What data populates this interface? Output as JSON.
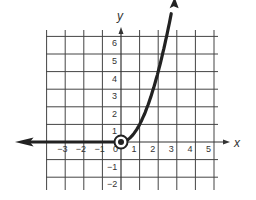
{
  "chart_data": {
    "type": "line",
    "title": "",
    "xlabel": "x",
    "ylabel": "y",
    "xlim": [
      -4,
      6
    ],
    "ylim": [
      -2,
      7
    ],
    "grid": true,
    "x_ticks": [
      -3,
      -2,
      -1,
      0,
      1,
      2,
      3,
      4,
      5
    ],
    "y_ticks": [
      -2,
      -1,
      1,
      2,
      3,
      4,
      5,
      6
    ],
    "x_tick_labels": [
      "−3",
      "−2",
      "−1",
      "0",
      "1",
      "2",
      "3",
      "4",
      "5"
    ],
    "y_tick_labels": [
      "−2",
      "−1",
      "1",
      "2",
      "3",
      "4",
      "5",
      "6"
    ],
    "series": [
      {
        "name": "piecewise f(x)",
        "description": "y = 0 for x < 0 (ray to the left with arrow); y = x^2 for x >= 0 (arrow upward)",
        "x": [
          -4.5,
          -3,
          -2,
          -1,
          0,
          0.5,
          1,
          1.5,
          2,
          2.5,
          2.8
        ],
        "y": [
          0,
          0,
          0,
          0,
          0,
          0.25,
          1,
          2.25,
          4,
          6.25,
          7.0
        ]
      }
    ],
    "annotations": [
      {
        "type": "circled-point",
        "x": 0,
        "y": 0,
        "label": "closed point at origin"
      }
    ]
  },
  "axes": {
    "x_label": "x",
    "y_label": "y",
    "origin_label": "0"
  },
  "colors": {
    "grid": "#333333",
    "curve": "#222222",
    "background": "#ffffff"
  }
}
